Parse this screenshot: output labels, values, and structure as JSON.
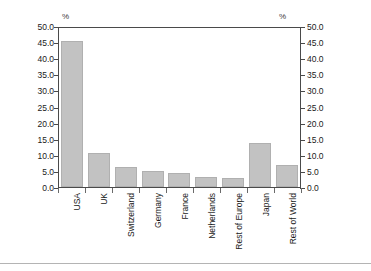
{
  "chart_data": {
    "type": "bar",
    "title": "",
    "xlabel": "",
    "ylabel": "%",
    "ylabel_right": "%",
    "categories": [
      "USA",
      "UK",
      "Switzerland",
      "Germany",
      "France",
      "Netherlands",
      "Rest of Europe",
      "Japan",
      "Rest of World"
    ],
    "values": [
      46.0,
      10.8,
      6.4,
      5.0,
      4.5,
      3.0,
      2.8,
      13.9,
      7.0
    ],
    "ylim": [
      0.0,
      50.0
    ],
    "ytick_labels": [
      "50.0",
      "45.0",
      "40.0",
      "35.0",
      "30.0",
      "25.0",
      "20.0",
      "15.0",
      "10.0",
      "5.0",
      "0.0"
    ],
    "ytick_values": [
      50.0,
      45.0,
      40.0,
      35.0,
      30.0,
      25.0,
      20.0,
      15.0,
      10.0,
      5.0,
      0.0
    ],
    "ytick_labels_right": [
      "50.0",
      "45.0",
      "40.0",
      "35.0",
      "30.0",
      "25.0",
      "20.0",
      "15.0",
      "10.0",
      "5.0",
      "0.0"
    ],
    "grid": false,
    "legend": false,
    "bar_color": "#c2c2c2",
    "axis_color": "#4a4a4a",
    "dual_axis": true
  }
}
